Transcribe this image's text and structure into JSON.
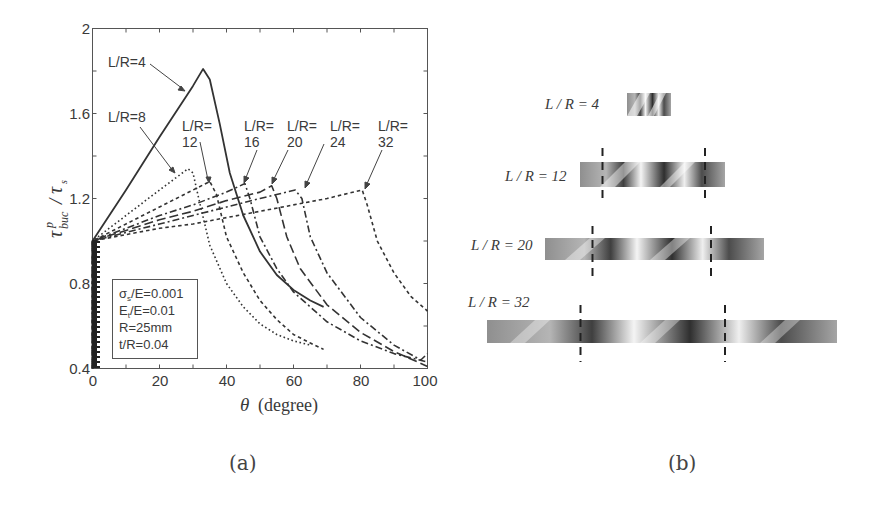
{
  "panel_a": {
    "caption": "(a)",
    "ylabel_main": "τ",
    "ylabel_sup": "p",
    "ylabel_sub": "buc",
    "ylabel_div": "/",
    "ylabel_den": "τ",
    "ylabel_den_sub": "s",
    "xlabel_symbol": "θ",
    "xlabel_unit": "(degree)",
    "legend": {
      "lines": [
        "σs/E=0.001",
        "Et/E=0.01",
        "R=25mm",
        "t/R=0.04"
      ],
      "line1_main": "σ",
      "line1_sub": "s",
      "line1_rest": "/E=0.001",
      "line2_main": "E",
      "line2_sub": "t",
      "line2_rest": "/E=0.01",
      "line3": "R=25mm",
      "line4": "t/R=0.04"
    },
    "annotations": {
      "lr4": "L/R=4",
      "lr8": "L/R=8",
      "lr12_a": "L/R=",
      "lr12_b": "12",
      "lr16_a": "L/R=",
      "lr16_b": "16",
      "lr20_a": "L/R=",
      "lr20_b": "20",
      "lr24_a": "L/R=",
      "lr24_b": "24",
      "lr32_a": "L/R=",
      "lr32_b": "32"
    },
    "xticks": [
      "0",
      "20",
      "40",
      "60",
      "80",
      "100"
    ],
    "yticks": [
      "0.4",
      "0.8",
      "1.2",
      "1.6",
      "2"
    ]
  },
  "panel_b": {
    "caption": "(b)",
    "cylinders": [
      {
        "label": "L / R = 4"
      },
      {
        "label": "L / R = 12"
      },
      {
        "label": "L / R = 20"
      },
      {
        "label": "L / R = 32"
      }
    ]
  },
  "chart_data": {
    "type": "line",
    "title": "",
    "xlabel": "θ (degree)",
    "ylabel": "τ^p_buc / τ_s",
    "xlim": [
      0,
      100
    ],
    "ylim": [
      0.4,
      2.0
    ],
    "xticks": [
      0,
      20,
      40,
      60,
      80,
      100
    ],
    "yticks": [
      0.4,
      0.8,
      1.2,
      1.6,
      2.0
    ],
    "grid": false,
    "legend_text": [
      "σs/E=0.001",
      "Et/E=0.01",
      "R=25mm",
      "t/R=0.04"
    ],
    "legend_position": "lower-left inset",
    "series": [
      {
        "name": "L/R=4",
        "style": "solid",
        "x": [
          0,
          0,
          10,
          20,
          30,
          33,
          35,
          38,
          41,
          45,
          50,
          55,
          60,
          65,
          69
        ],
        "y": [
          0.4,
          1.0,
          1.24,
          1.49,
          1.73,
          1.81,
          1.76,
          1.55,
          1.32,
          1.12,
          0.95,
          0.84,
          0.77,
          0.72,
          0.69
        ]
      },
      {
        "name": "L/R=8",
        "style": "dotted",
        "x": [
          0,
          0,
          10,
          20,
          28.5,
          30,
          32,
          35,
          40,
          45,
          50,
          55,
          60,
          65
        ],
        "y": [
          0.4,
          1.0,
          1.12,
          1.24,
          1.34,
          1.32,
          1.18,
          0.98,
          0.8,
          0.69,
          0.61,
          0.56,
          0.53,
          0.51
        ]
      },
      {
        "name": "L/R=12",
        "style": "short-dash",
        "x": [
          0,
          0,
          10,
          20,
          30,
          35,
          37,
          40,
          45,
          50,
          55,
          60,
          65,
          69
        ],
        "y": [
          0.4,
          1.0,
          1.08,
          1.16,
          1.24,
          1.28,
          1.22,
          1.02,
          0.85,
          0.72,
          0.63,
          0.56,
          0.52,
          0.49
        ]
      },
      {
        "name": "L/R=16",
        "style": "dash-dot",
        "x": [
          0,
          0,
          10,
          20,
          30,
          40,
          45.5,
          47,
          50,
          55,
          60,
          70,
          80,
          90,
          100
        ],
        "y": [
          0.4,
          1.0,
          1.06,
          1.12,
          1.17,
          1.23,
          1.27,
          1.2,
          1.02,
          0.87,
          0.76,
          0.62,
          0.53,
          0.47,
          0.43
        ]
      },
      {
        "name": "L/R=20",
        "style": "long-dash",
        "x": [
          0,
          0,
          10,
          20,
          30,
          40,
          50,
          53.5,
          55,
          58,
          62,
          70,
          80,
          90,
          100
        ],
        "y": [
          0.4,
          1.0,
          1.05,
          1.1,
          1.14,
          1.19,
          1.23,
          1.26,
          1.2,
          1.02,
          0.87,
          0.7,
          0.57,
          0.48,
          0.41
        ]
      },
      {
        "name": "L/R=24",
        "style": "dash-dot",
        "x": [
          0,
          0,
          10,
          20,
          30,
          40,
          50,
          60.5,
          62.5,
          65,
          70,
          80,
          90,
          98,
          100
        ],
        "y": [
          0.4,
          1.0,
          1.04,
          1.08,
          1.12,
          1.16,
          1.2,
          1.24,
          1.2,
          1.02,
          0.85,
          0.64,
          0.51,
          0.44,
          0.47
        ]
      },
      {
        "name": "L/R=32",
        "style": "short-dash",
        "x": [
          0,
          0,
          10,
          20,
          30,
          40,
          50,
          60,
          70,
          80.5,
          82,
          85,
          90,
          95,
          100
        ],
        "y": [
          0.4,
          1.0,
          1.03,
          1.06,
          1.08,
          1.11,
          1.14,
          1.17,
          1.2,
          1.24,
          1.17,
          1.0,
          0.85,
          0.74,
          0.67
        ]
      }
    ]
  }
}
